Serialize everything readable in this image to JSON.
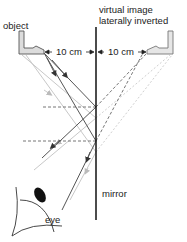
{
  "labels": {
    "object": "object",
    "virtual_image_line1": "virtual image",
    "virtual_image_line2": "laterally inverted",
    "distance_left": "10 cm",
    "distance_right": "10 cm",
    "eye": "eye",
    "mirror": "mirror"
  },
  "colors": {
    "mirror": "#111111",
    "ray_dark": "#555555",
    "ray_light": "#c8c8c8",
    "dashed": "#666666",
    "object_fill": "#dcdcdc"
  }
}
